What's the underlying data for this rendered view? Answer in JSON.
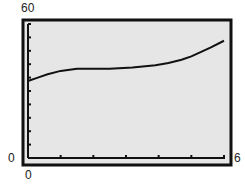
{
  "chart_data": {
    "type": "line",
    "title": "",
    "xlabel": "",
    "ylabel": "",
    "xlim": [
      0,
      6
    ],
    "ylim": [
      0,
      60
    ],
    "grid": false,
    "x_tick_count": 6,
    "y_tick_count": 10,
    "x": [
      0,
      0.3,
      0.6,
      1.0,
      1.5,
      2.0,
      2.5,
      3.2,
      3.9,
      4.3,
      4.7,
      5.0,
      5.3,
      5.6,
      6.0
    ],
    "values": [
      34.5,
      36,
      37.5,
      39,
      40,
      40,
      40,
      40.5,
      41.5,
      42.5,
      44,
      45.5,
      47.5,
      49.5,
      52.5
    ],
    "labels": {
      "y_max": "60",
      "y_min": "0",
      "x_min": "0",
      "x_max": "6"
    },
    "colors": {
      "background": "#e6e6e6",
      "line": "#111111",
      "frame": "#111111"
    }
  }
}
